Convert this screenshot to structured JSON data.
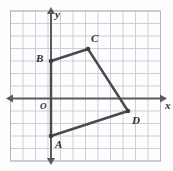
{
  "figure": {
    "colors": {
      "grid": "#c9c6d8",
      "grid_border": "#b5b2c6",
      "axis": "#5a5a5a",
      "shape_stroke": "#4a4a4a",
      "vertex": "#3d3d3d",
      "label": "#2f2f2f",
      "background": "#fdfdfd"
    },
    "grid": {
      "cell_px": 12.5,
      "left_px": 10.5,
      "top_px": 11,
      "cols": 12,
      "rows": 12,
      "show_grid": true
    },
    "axes": {
      "origin_px": {
        "x": 51,
        "y": 98.5
      },
      "x_axis": {
        "label": "x",
        "y_px": 98.5,
        "x_start_px": 11,
        "x_end_px": 162,
        "arrow_both_ends": true
      },
      "y_axis": {
        "label": "y",
        "x_px": 51,
        "y_start_px": 12,
        "y_end_px": 160,
        "arrow_both_ends": true
      },
      "origin_label": "O"
    },
    "shape": {
      "name": "quadrilateral-abcd",
      "closed": true,
      "vertices": [
        {
          "label": "A",
          "px": {
            "x": 51,
            "y": 136
          },
          "coord": {
            "x": 0,
            "y": -3
          },
          "label_px": {
            "x": 55,
            "y": 139
          }
        },
        {
          "label": "B",
          "px": {
            "x": 51,
            "y": 61
          },
          "coord": {
            "x": 0,
            "y": 3
          },
          "label_px": {
            "x": 36,
            "y": 53
          }
        },
        {
          "label": "C",
          "px": {
            "x": 88,
            "y": 49
          },
          "coord": {
            "x": 3,
            "y": 4
          },
          "label_px": {
            "x": 91,
            "y": 33
          }
        },
        {
          "label": "D",
          "px": {
            "x": 128,
            "y": 111
          },
          "coord": {
            "x": 6,
            "y": -1
          },
          "label_px": {
            "x": 132,
            "y": 115
          }
        }
      ],
      "edges": [
        "A-B",
        "B-C",
        "C-D",
        "D-A"
      ]
    }
  }
}
